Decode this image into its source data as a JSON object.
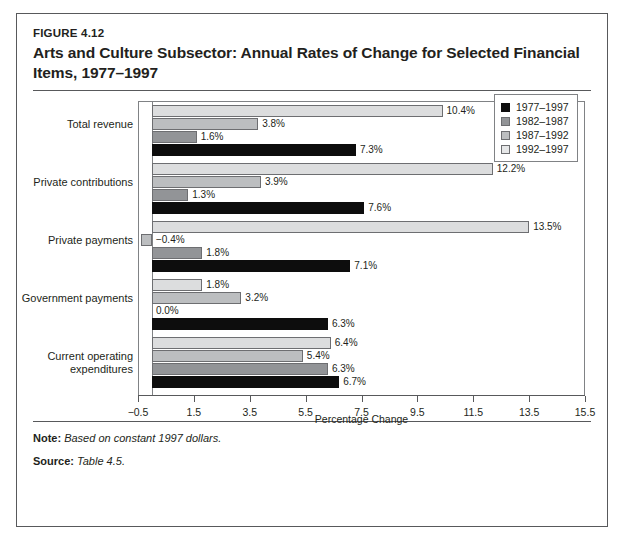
{
  "figure": {
    "number": "FIGURE 4.12",
    "title": "Arts and Culture Subsector: Annual Rates of Change for Selected Financial Items, 1977–1997"
  },
  "footer": {
    "note_label": "Note:",
    "note_text": " Based on constant 1997 dollars.",
    "source_label": "Source:",
    "source_text": " Table 4.5."
  },
  "chart_data": {
    "type": "bar",
    "orientation": "horizontal",
    "title": "Arts and Culture Subsector: Annual Rates of Change for Selected Financial Items, 1977–1997",
    "xlabel": "Percentage Change",
    "ylabel": "",
    "xlim": [
      -0.5,
      15.5
    ],
    "xticks": [
      "−0.5",
      "1.5",
      "3.5",
      "5.5",
      "7.5",
      "9.5",
      "11.5",
      "13.5",
      "15.5"
    ],
    "xtick_values": [
      -0.5,
      1.5,
      3.5,
      5.5,
      7.5,
      9.5,
      11.5,
      13.5,
      15.5
    ],
    "grid": false,
    "legend_position": "top-right",
    "categories": [
      "Total revenue",
      "Private contributions",
      "Private payments",
      "Government payments",
      "Current operating expenditures"
    ],
    "series": [
      {
        "name": "1977–1997",
        "color": "#0d0d0d",
        "values": [
          7.3,
          7.6,
          7.1,
          6.3,
          6.7
        ],
        "labels": [
          "7.3%",
          "7.6%",
          "7.1%",
          "6.3%",
          "6.7%"
        ]
      },
      {
        "name": "1982–1987",
        "color": "#929497",
        "values": [
          1.6,
          1.3,
          1.8,
          0.0,
          6.3
        ],
        "labels": [
          "1.6%",
          "1.3%",
          "1.8%",
          "0.0%",
          "6.3%"
        ]
      },
      {
        "name": "1987–1992",
        "color": "#bcbec0",
        "values": [
          3.8,
          3.9,
          -0.4,
          3.2,
          5.4
        ],
        "labels": [
          "3.8%",
          "3.9%",
          "−0.4%",
          "3.2%",
          "5.4%"
        ]
      },
      {
        "name": "1992–1997",
        "color": "#dcddde",
        "values": [
          10.4,
          12.2,
          13.5,
          1.8,
          6.4
        ],
        "labels": [
          "10.4%",
          "12.2%",
          "13.5%",
          "1.8%",
          "6.4%"
        ]
      }
    ]
  }
}
